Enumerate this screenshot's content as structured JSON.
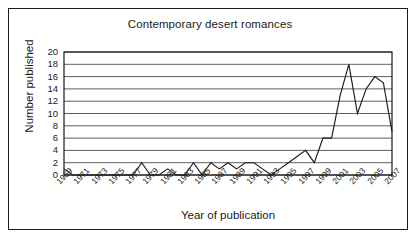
{
  "chart_data": {
    "type": "line",
    "title": "Contemporary desert romances",
    "xlabel": "Year of publication",
    "ylabel": "Number published",
    "x": [
      1969,
      1970,
      1971,
      1972,
      1973,
      1974,
      1975,
      1976,
      1977,
      1978,
      1979,
      1980,
      1981,
      1982,
      1983,
      1984,
      1985,
      1986,
      1987,
      1988,
      1989,
      1990,
      1991,
      1992,
      1993,
      1994,
      1995,
      1996,
      1997,
      1998,
      1999,
      2000,
      2001,
      2002,
      2003,
      2004,
      2005,
      2006,
      2007
    ],
    "values": [
      1,
      0,
      0,
      0,
      0,
      0,
      0,
      0,
      0,
      2,
      0,
      0,
      1,
      0,
      0,
      2,
      0,
      2,
      1,
      2,
      1,
      2,
      2,
      1,
      0,
      1,
      2,
      3,
      4,
      2,
      6,
      6,
      13,
      18,
      10,
      14,
      16,
      15,
      7
    ],
    "series": [
      {
        "name": "Number published",
        "values": [
          1,
          0,
          0,
          0,
          0,
          0,
          0,
          0,
          0,
          2,
          0,
          0,
          1,
          0,
          0,
          2,
          0,
          2,
          1,
          2,
          1,
          2,
          2,
          1,
          0,
          1,
          2,
          3,
          4,
          2,
          6,
          6,
          13,
          18,
          10,
          14,
          16,
          15,
          7
        ]
      }
    ],
    "xlim": [
      1969,
      2007
    ],
    "ylim": [
      0,
      20
    ],
    "ytick_labels": [
      "20",
      "18",
      "16",
      "14",
      "12",
      "10",
      "8",
      "6",
      "4",
      "2",
      "0"
    ],
    "ytick_values": [
      20,
      18,
      16,
      14,
      12,
      10,
      8,
      6,
      4,
      2,
      0
    ],
    "xtick_labels": [
      "1969",
      "1971",
      "1973",
      "1975",
      "1977",
      "1979",
      "1981",
      "1983",
      "1985",
      "1987",
      "1989",
      "1991",
      "1993",
      "1995",
      "1997",
      "1999",
      "2001",
      "2003",
      "2005",
      "2007"
    ],
    "xtick_values": [
      1969,
      1971,
      1973,
      1975,
      1977,
      1979,
      1981,
      1983,
      1985,
      1987,
      1989,
      1991,
      1993,
      1995,
      1997,
      1999,
      2001,
      2003,
      2005,
      2007
    ],
    "grid": "horizontal",
    "legend": "none",
    "line_color": "#1a1a1a",
    "grid_color": "#4d4d4d",
    "background": "#ffffff"
  }
}
